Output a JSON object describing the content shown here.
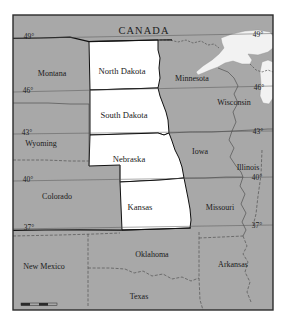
{
  "figure": {
    "kind": "reference-map",
    "frame": {
      "border_color": "#2b2b2b",
      "background": "#ffffff"
    }
  },
  "colors": {
    "land_fill": "#a8a8a8",
    "highlight_fill": "#ffffff",
    "water_fill": "#f2f2f2",
    "state_border": "#4a4a4a",
    "national_border": "#111111",
    "highlight_border": "#111111",
    "text": "#1a1a1a",
    "frame": "#2b2b2b"
  },
  "country_labels": [
    {
      "name": "canada",
      "text": "CANADA",
      "x": 144,
      "y": 32
    }
  ],
  "highlighted_states": [
    {
      "name": "north-dakota",
      "label": "North Dakota",
      "x": 122,
      "y": 72
    },
    {
      "name": "south-dakota",
      "label": "South Dakota",
      "x": 124,
      "y": 116
    },
    {
      "name": "nebraska",
      "label": "Nebraska",
      "x": 129,
      "y": 160
    },
    {
      "name": "kansas",
      "label": "Kansas",
      "x": 140,
      "y": 208
    }
  ],
  "other_states": [
    {
      "name": "montana",
      "label": "Montana",
      "x": 52,
      "y": 74
    },
    {
      "name": "wyoming",
      "label": "Wyoming",
      "x": 41,
      "y": 144
    },
    {
      "name": "colorado",
      "label": "Colorado",
      "x": 57,
      "y": 197
    },
    {
      "name": "new-mexico",
      "label": "New Mexico",
      "x": 44,
      "y": 267
    },
    {
      "name": "minnesota",
      "label": "Minnesota",
      "x": 192,
      "y": 79
    },
    {
      "name": "wisconsin",
      "label": "Wisconsin",
      "x": 234,
      "y": 103
    },
    {
      "name": "iowa",
      "label": "Iowa",
      "x": 200,
      "y": 152
    },
    {
      "name": "illinois",
      "label": "Illinois",
      "x": 248,
      "y": 168
    },
    {
      "name": "missouri",
      "label": "Missouri",
      "x": 220,
      "y": 208
    },
    {
      "name": "arkansas",
      "label": "Arkansas",
      "x": 233,
      "y": 265
    },
    {
      "name": "oklahoma",
      "label": "Oklahoma",
      "x": 152,
      "y": 255
    },
    {
      "name": "texas",
      "label": "Texas",
      "x": 139,
      "y": 297
    }
  ],
  "latitude_lines": [
    {
      "name": "lat-49",
      "label": "49°",
      "left_x": 29,
      "left_y": 37,
      "right_x": 258,
      "right_y": 35,
      "y_left": 38,
      "y_right": 33
    },
    {
      "name": "lat-46",
      "label": "46°",
      "left_x": 28,
      "left_y": 91,
      "right_x": 259,
      "right_y": 88,
      "y_left": 92,
      "y_right": 86
    },
    {
      "name": "lat-43",
      "label": "43°",
      "left_x": 27,
      "left_y": 133,
      "right_x": 258,
      "right_y": 132,
      "y_left": 134,
      "y_right": 131
    },
    {
      "name": "lat-40",
      "label": "40°",
      "left_x": 28,
      "left_y": 180,
      "right_x": 257,
      "right_y": 178,
      "y_left": 181,
      "y_right": 177
    },
    {
      "name": "lat-37",
      "label": "37°",
      "left_x": 29,
      "left_y": 228,
      "right_x": 257,
      "right_y": 226,
      "y_left": 229,
      "y_right": 225
    }
  ],
  "scale_bar": {
    "name": "scale-bar",
    "x": 21,
    "y": 303,
    "width": 36,
    "height": 3
  },
  "water_bodies": [
    {
      "name": "lake-superior"
    },
    {
      "name": "lake-michigan"
    }
  ]
}
